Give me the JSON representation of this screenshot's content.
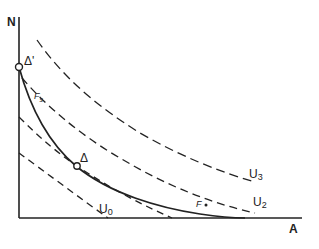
{
  "diagram": {
    "type": "indifference-curve-diagram",
    "axes": {
      "y_label": "N",
      "x_label": "A"
    },
    "curves": [
      {
        "id": "U0",
        "label": "U",
        "subscript": "0",
        "style": "dashed"
      },
      {
        "id": "U1",
        "label": "",
        "subscript": "",
        "style": "dashed"
      },
      {
        "id": "U2",
        "label": "U",
        "subscript": "2",
        "style": "dashed"
      },
      {
        "id": "U3",
        "label": "U",
        "subscript": "3",
        "style": "dashed"
      },
      {
        "id": "frontier",
        "label": "",
        "subscript": "",
        "style": "solid"
      }
    ],
    "points": [
      {
        "id": "delta_prime",
        "label": "Δ'",
        "marker": "hollow-circle"
      },
      {
        "id": "delta",
        "label": "Δ",
        "marker": "hollow-circle"
      },
      {
        "id": "F",
        "label": "F",
        "marker": "dot"
      }
    ],
    "annotations": {
      "f_s": {
        "main": "F",
        "subscript": "s"
      }
    },
    "colors": {
      "ink": "#222222",
      "background": "#ffffff"
    }
  }
}
